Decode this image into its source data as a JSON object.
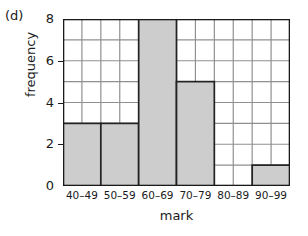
{
  "figure": {
    "part_label": "(d)",
    "background_color": "#ffffff"
  },
  "chart_data": {
    "type": "bar",
    "title": "",
    "subtitle": "",
    "categories": [
      "40–49",
      "50–59",
      "60–69",
      "70–79",
      "80–89",
      "90–99"
    ],
    "values": [
      3,
      3,
      8,
      5,
      0,
      1
    ],
    "xlabel": "mark",
    "ylabel": "frequency",
    "ylim": [
      0,
      8
    ],
    "y_ticks": [
      0,
      2,
      4,
      6,
      8
    ],
    "y_tick_labels": [
      "0",
      "2",
      "4",
      "6",
      "8"
    ],
    "y_gridlines": [
      1,
      2,
      3,
      4,
      5,
      6,
      7,
      8
    ],
    "x_subdivisions_per_category": 2,
    "grid": true,
    "legend": false,
    "bar_fill_color": "#cdcdcd",
    "bar_edge_color": "#222222",
    "grid_color": "#909090",
    "axis_color": "#1a1a1a"
  }
}
